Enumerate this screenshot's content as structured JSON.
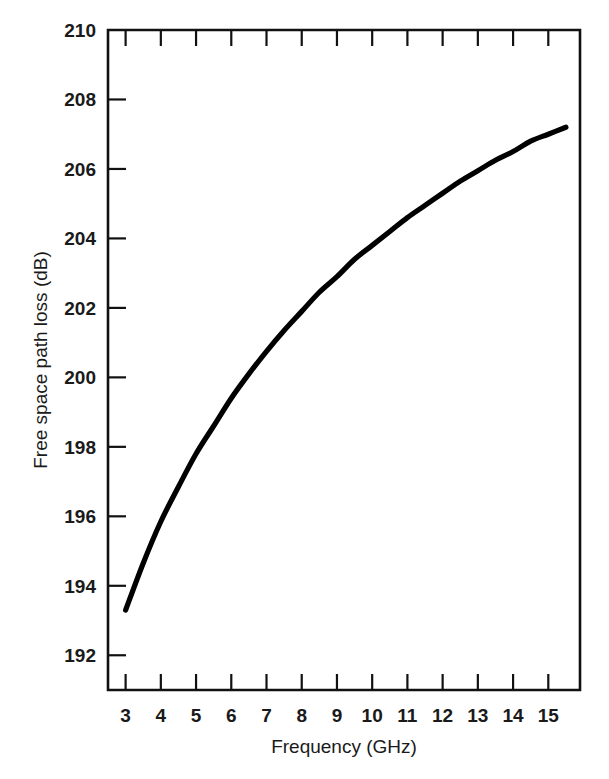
{
  "chart_data": {
    "type": "line",
    "title": "",
    "xlabel": "Frequency (GHz)",
    "ylabel": "Free space path loss (dB)",
    "xlim": [
      2.5,
      15.9
    ],
    "ylim": [
      191.0,
      210.0
    ],
    "grid": false,
    "legend": null,
    "x_tick_labels": [
      "3",
      "4",
      "5",
      "6",
      "7",
      "8",
      "9",
      "10",
      "11",
      "12",
      "13",
      "14",
      "15"
    ],
    "x_ticks": [
      3,
      4,
      5,
      6,
      7,
      8,
      9,
      10,
      11,
      12,
      13,
      14,
      15
    ],
    "y_tick_labels": [
      "210",
      "208",
      "206",
      "204",
      "202",
      "200",
      "198",
      "196",
      "194",
      "192"
    ],
    "y_ticks": [
      210,
      208,
      206,
      204,
      202,
      200,
      198,
      196,
      194,
      192
    ],
    "series": [
      {
        "name": "Free space path loss",
        "color": "#000000",
        "x": [
          3.0,
          3.5,
          4.0,
          4.5,
          5.0,
          5.5,
          6.0,
          6.5,
          7.0,
          7.5,
          8.0,
          8.5,
          9.0,
          9.5,
          10.0,
          10.5,
          11.0,
          11.5,
          12.0,
          12.5,
          13.0,
          13.5,
          14.0,
          14.5,
          15.0,
          15.5
        ],
        "y": [
          193.3,
          194.65,
          195.85,
          196.85,
          197.8,
          198.6,
          199.4,
          200.1,
          200.75,
          201.35,
          201.9,
          202.45,
          202.9,
          203.4,
          203.8,
          204.2,
          204.6,
          204.95,
          205.3,
          205.65,
          205.95,
          206.25,
          206.5,
          206.8,
          207.0,
          207.2
        ]
      }
    ],
    "annotations": []
  },
  "axis": {
    "x_title": "Frequency (GHz)",
    "y_title": "Free space path loss (dB)"
  }
}
